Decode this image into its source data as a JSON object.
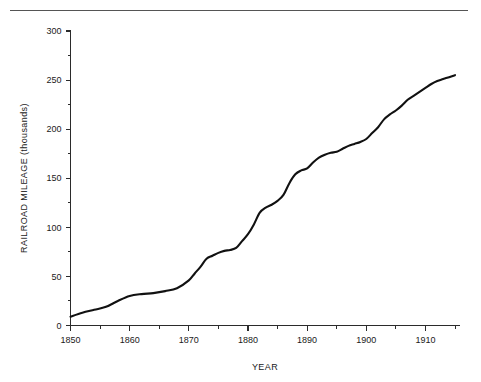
{
  "chart_data": {
    "type": "line",
    "title": "",
    "xlabel": "YEAR",
    "ylabel": "RAILROAD MILEAGE (thousands)",
    "xlim": [
      1850,
      1915
    ],
    "ylim": [
      0,
      300
    ],
    "grid": false,
    "legend": "none",
    "x_ticks_major": [
      1850,
      1860,
      1870,
      1880,
      1890,
      1900,
      1910
    ],
    "x_ticks_major_labels": [
      "1850",
      "1860",
      "1870",
      "1880",
      "1890",
      "1900",
      "1910"
    ],
    "x_ticks_minor": [
      1855,
      1865,
      1875,
      1885,
      1895,
      1905,
      1915
    ],
    "y_ticks_major": [
      0,
      50,
      100,
      150,
      200,
      250,
      300
    ],
    "y_ticks_major_labels": [
      "0",
      "50",
      "100",
      "150",
      "200",
      "250",
      "300"
    ],
    "y_ticks_minor": [
      25,
      75,
      125,
      175,
      225,
      275
    ],
    "series": [
      {
        "name": "Railroad mileage",
        "color": "#111111",
        "x": [
          1850,
          1852,
          1854,
          1856,
          1858,
          1860,
          1862,
          1864,
          1866,
          1868,
          1870,
          1871,
          1872,
          1873,
          1874,
          1875,
          1876,
          1877,
          1878,
          1879,
          1880,
          1881,
          1882,
          1883,
          1884,
          1885,
          1886,
          1887,
          1888,
          1889,
          1890,
          1891,
          1892,
          1893,
          1894,
          1895,
          1896,
          1897,
          1898,
          1899,
          1900,
          1901,
          1902,
          1903,
          1904,
          1905,
          1906,
          1907,
          1908,
          1909,
          1910,
          1911,
          1912,
          1913,
          1914,
          1915
        ],
        "values": [
          9,
          13,
          16,
          19,
          25,
          30,
          32,
          33,
          35,
          38,
          46,
          53,
          60,
          68,
          71,
          74,
          76,
          77,
          79,
          86,
          93,
          103,
          115,
          120,
          123,
          127,
          133,
          145,
          154,
          158,
          160,
          166,
          171,
          174,
          176,
          177,
          180,
          183,
          185,
          187,
          190,
          196,
          202,
          210,
          215,
          219,
          224,
          230,
          234,
          238,
          242,
          246,
          249,
          251,
          253,
          255
        ]
      }
    ]
  },
  "axes": {
    "y_title": "RAILROAD MILEAGE (thousands)",
    "x_title": "YEAR"
  },
  "decorations": {
    "top_rule": "horizontal-rule"
  }
}
